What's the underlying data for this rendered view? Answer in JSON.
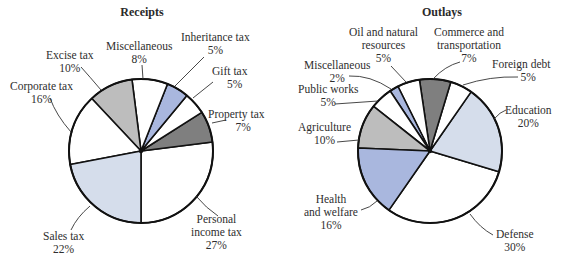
{
  "chart_data": [
    {
      "type": "pie",
      "title": "Receipts",
      "center": [
        141,
        151
      ],
      "radius": 72,
      "start_angle_deg": 90,
      "direction": "counterclockwise",
      "slices": [
        {
          "label": "Personal income tax",
          "value": 27,
          "color": "#ffffff"
        },
        {
          "label": "Property tax",
          "value": 7,
          "color": "#7f7f7f"
        },
        {
          "label": "Gift tax",
          "value": 5,
          "color": "#ffffff"
        },
        {
          "label": "Inheritance tax",
          "value": 5,
          "color": "#a9b7de"
        },
        {
          "label": "Miscellaneous",
          "value": 8,
          "color": "#ffffff"
        },
        {
          "label": "Excise tax",
          "value": 10,
          "color": "#bdbdbd"
        },
        {
          "label": "Corporate tax",
          "value": 16,
          "color": "#ffffff"
        },
        {
          "label": "Sales tax",
          "value": 22,
          "color": "#d5ddeb"
        }
      ]
    },
    {
      "type": "pie",
      "title": "Outlays",
      "center": [
        430,
        151
      ],
      "radius": 72,
      "start_angle_deg": 124.8,
      "direction": "counterclockwise",
      "slices": [
        {
          "label": "Defense",
          "value": 30,
          "color": "#ffffff"
        },
        {
          "label": "Education",
          "value": 20,
          "color": "#d5ddeb"
        },
        {
          "label": "Foreign debt",
          "value": 5,
          "color": "#ffffff"
        },
        {
          "label": "Commerce and transportation",
          "value": 7,
          "color": "#7f7f7f"
        },
        {
          "label": "Oil and natural resources",
          "value": 5,
          "color": "#ffffff"
        },
        {
          "label": "Miscellaneous",
          "value": 2,
          "color": "#a9b7de"
        },
        {
          "label": "Public works",
          "value": 5,
          "color": "#ffffff"
        },
        {
          "label": "Agriculture",
          "value": 10,
          "color": "#bdbdbd"
        },
        {
          "label": "Health and welfare",
          "value": 16,
          "color": "#a9b7de"
        }
      ]
    }
  ],
  "receipts": {
    "title": "Receipts",
    "labels": {
      "personal_income": {
        "line1": "Personal",
        "line2": "income tax",
        "pct": "27%"
      },
      "property": {
        "line1": "Property tax",
        "pct": "7%"
      },
      "gift": {
        "line1": "Gift tax",
        "pct": "5%"
      },
      "inheritance": {
        "line1": "Inheritance tax",
        "pct": "5%"
      },
      "misc": {
        "line1": "Miscellaneous",
        "pct": "8%"
      },
      "excise": {
        "line1": "Excise tax",
        "pct": "10%"
      },
      "corporate": {
        "line1": "Corporate tax",
        "pct": "16%"
      },
      "sales": {
        "line1": "Sales tax",
        "pct": "22%"
      }
    }
  },
  "outlays": {
    "title": "Outlays",
    "labels": {
      "defense": {
        "line1": "Defense",
        "pct": "30%"
      },
      "education": {
        "line1": "Education",
        "pct": "20%"
      },
      "foreign_debt": {
        "line1": "Foreign debt",
        "pct": "5%"
      },
      "commerce": {
        "line1": "Commerce and",
        "line2": "transportation",
        "pct": "7%"
      },
      "oil": {
        "line1": "Oil and natural",
        "line2": "resources",
        "pct": "5%"
      },
      "misc": {
        "line1": "Miscellaneous",
        "pct": "2%"
      },
      "public_works": {
        "line1": "Public works",
        "pct": "5%"
      },
      "agriculture": {
        "line1": "Agriculture",
        "pct": "10%"
      },
      "health": {
        "line1": "Health",
        "line2": "and welfare",
        "pct": "16%"
      }
    }
  }
}
